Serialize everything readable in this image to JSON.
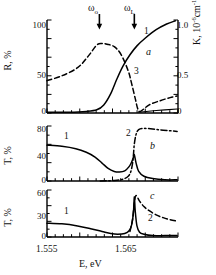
{
  "figure": {
    "xlabel": "E, eV",
    "xticklabels": [
      "1.555",
      "1.565"
    ],
    "panels": [
      {
        "id": "a",
        "letter": "a",
        "ylabel_left": "R, %",
        "ylabel_right": "K, 10",
        "ylabel_right_sup": "-6",
        "ylabel_right_tail": "cm",
        "ylabel_right_sup2": "-1",
        "yticks_left": [
          "0",
          "50",
          "100"
        ],
        "yticks_right": [
          "0",
          "0.5",
          "1.0"
        ],
        "curve_labels": [
          "1",
          "3"
        ],
        "annotations": [
          {
            "text": "ω",
            "sub": "o"
          },
          {
            "text": "ω",
            "sub": "L"
          }
        ]
      },
      {
        "id": "b",
        "letter": "b",
        "ylabel_left": "T, %",
        "yticks_left": [
          "0",
          "40",
          "80"
        ],
        "curve_labels": [
          "1",
          "2"
        ]
      },
      {
        "id": "c",
        "letter": "c",
        "ylabel_left": "T, %",
        "yticks_left": [
          "0",
          "30",
          "60"
        ],
        "curve_labels": [
          "1",
          "2"
        ]
      }
    ]
  },
  "chart_data": {
    "type": "line",
    "title": "",
    "xlabel": "E, eV",
    "xlim": [
      1.5535,
      1.5685
    ],
    "panels": [
      {
        "id": "a",
        "ylabel": "R, %",
        "ylim": [
          0,
          115
        ],
        "ylabel_right": "K, 10^-6 cm^-1",
        "ylim_right": [
          0,
          1.15
        ],
        "annotations": [
          {
            "label": "ωo",
            "x": 1.5595
          },
          {
            "label": "ωL",
            "x": 1.5635
          }
        ],
        "series": [
          {
            "name": "1",
            "style": "solid",
            "axis": "left",
            "x": [
              1.5535,
              1.556,
              1.558,
              1.5592,
              1.56,
              1.5608,
              1.5615,
              1.5622,
              1.563,
              1.5638,
              1.5648,
              1.566,
              1.5672,
              1.5682
            ],
            "y": [
              1,
              1,
              2,
              4,
              10,
              24,
              42,
              58,
              72,
              83,
              93,
              103,
              110,
              114
            ]
          },
          {
            "name": "3",
            "style": "dashed",
            "axis": "right",
            "x": [
              1.5535,
              1.5552,
              1.557,
              1.5582,
              1.5592,
              1.5598,
              1.5604,
              1.5612,
              1.562,
              1.5628,
              1.5632,
              1.5636,
              1.5639,
              1.5642,
              1.5652,
              1.5664,
              1.5676,
              1.5684
            ],
            "y": [
              0.4,
              0.46,
              0.56,
              0.7,
              0.84,
              0.86,
              0.85,
              0.82,
              0.72,
              0.52,
              0.36,
              0.18,
              0.05,
              0.02,
              0.1,
              0.15,
              0.19,
              0.21
            ]
          },
          {
            "name": "baseline",
            "style": "solid",
            "axis": "left",
            "x": [
              1.564,
              1.566,
              1.5684
            ],
            "y": [
              1,
              3,
              5
            ]
          }
        ]
      },
      {
        "id": "b",
        "ylabel": "T, %",
        "ylim": [
          0,
          92
        ],
        "series": [
          {
            "name": "1",
            "style": "solid",
            "x": [
              1.5535,
              1.5552,
              1.5568,
              1.558,
              1.559,
              1.5598,
              1.5605,
              1.5612,
              1.5618,
              1.5624,
              1.5629,
              1.5632,
              1.5634,
              1.5635,
              1.5637,
              1.564,
              1.5646,
              1.5656,
              1.567,
              1.5684
            ],
            "y": [
              60,
              58,
              54,
              48,
              40,
              30,
              21,
              16,
              15,
              17,
              24,
              32,
              40,
              44,
              30,
              16,
              8,
              4,
              2,
              2
            ]
          },
          {
            "name": "2",
            "style": "dashdot",
            "x": [
              1.5596,
              1.5612,
              1.5622,
              1.5628,
              1.5631,
              1.5633,
              1.5634,
              1.5635,
              1.5637,
              1.564,
              1.5646,
              1.5656,
              1.5668,
              1.5684
            ],
            "y": [
              0,
              1,
              3,
              8,
              16,
              30,
              44,
              62,
              78,
              86,
              88,
              87,
              85,
              83
            ]
          }
        ]
      },
      {
        "id": "c",
        "ylabel": "T, %",
        "ylim": [
          0,
          68
        ],
        "series": [
          {
            "name": "1",
            "style": "solid",
            "x": [
              1.5535,
              1.5552,
              1.557,
              1.5585,
              1.5598,
              1.5608,
              1.5616,
              1.5624,
              1.5629,
              1.5632,
              1.5634,
              1.5635,
              1.5636,
              1.5638,
              1.5641,
              1.5646,
              1.5656,
              1.567,
              1.5684
            ],
            "y": [
              20,
              19,
              16,
              12,
              8,
              5,
              4,
              5,
              9,
              18,
              36,
              58,
              38,
              16,
              7,
              4,
              2,
              2,
              2
            ]
          },
          {
            "name": "2",
            "style": "dashed",
            "x": [
              1.563,
              1.5633,
              1.5635,
              1.5637,
              1.5641,
              1.5646,
              1.5652,
              1.566,
              1.5668,
              1.5676,
              1.5684
            ],
            "y": [
              8,
              26,
              50,
              60,
              52,
              44,
              38,
              32,
              28,
              25,
              23
            ]
          }
        ]
      }
    ]
  }
}
